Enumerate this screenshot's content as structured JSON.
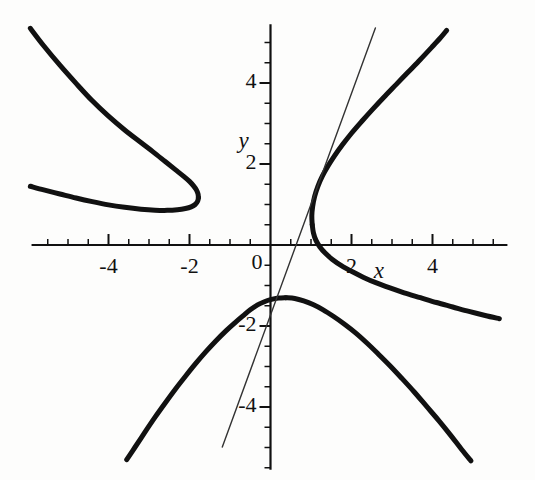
{
  "figure": {
    "width": 535,
    "height": 480,
    "background": "#fdfdfc",
    "ink_color": "#111111"
  },
  "axis_names": {
    "x": "x",
    "y": "y"
  },
  "chart_data": {
    "type": "line",
    "title": "",
    "subtitle": "",
    "xlabel": "x",
    "ylabel": "y",
    "grid": false,
    "legend": null,
    "legend_position": "none",
    "xlim": [
      -5.9,
      5.85
    ],
    "ylim": [
      -5.55,
      5.45
    ],
    "xticks_major": [
      -4,
      -2,
      0,
      2,
      4
    ],
    "yticks_major": [
      -4,
      -2,
      0,
      2,
      4
    ],
    "xtick_labels": [
      "-4",
      "-2",
      "0",
      "2",
      "4"
    ],
    "ytick_labels": [
      "-4",
      "-2",
      "0",
      "2",
      "4"
    ],
    "minor_tick_step": 0.5,
    "axes_style": "centered-cross",
    "curve_description": "elliptic curve with two real components: a closed oval on the left and an unbounded branch on the right, plus a straight secant line",
    "series": [
      {
        "name": "oval-component-upper",
        "style": "thick",
        "linewidth": 5,
        "color": "#111111",
        "points": [
          [
            -5.93,
            5.35
          ],
          [
            -5.6,
            4.92
          ],
          [
            -5.2,
            4.44
          ],
          [
            -4.8,
            3.99
          ],
          [
            -4.4,
            3.56
          ],
          [
            -4.0,
            3.18
          ],
          [
            -3.6,
            2.84
          ],
          [
            -3.2,
            2.53
          ],
          [
            -2.9,
            2.3
          ],
          [
            -2.6,
            2.06
          ],
          [
            -2.35,
            1.86
          ],
          [
            -2.15,
            1.7
          ],
          [
            -2.0,
            1.57
          ],
          [
            -1.9,
            1.46
          ],
          [
            -1.83,
            1.36
          ],
          [
            -1.79,
            1.26
          ],
          [
            -1.78,
            1.17
          ]
        ]
      },
      {
        "name": "oval-component-lower",
        "style": "thick",
        "linewidth": 5,
        "color": "#111111",
        "points": [
          [
            -1.78,
            1.17
          ],
          [
            -1.8,
            1.08
          ],
          [
            -1.86,
            1.0
          ],
          [
            -1.96,
            0.94
          ],
          [
            -2.1,
            0.9
          ],
          [
            -2.3,
            0.87
          ],
          [
            -2.55,
            0.855
          ],
          [
            -2.85,
            0.86
          ],
          [
            -3.2,
            0.885
          ],
          [
            -3.6,
            0.93
          ],
          [
            -4.0,
            0.99
          ],
          [
            -4.4,
            1.07
          ],
          [
            -4.8,
            1.16
          ],
          [
            -5.2,
            1.26
          ],
          [
            -5.6,
            1.36
          ],
          [
            -5.93,
            1.45
          ]
        ]
      },
      {
        "name": "right-branch-upper",
        "style": "thick",
        "linewidth": 5,
        "color": "#111111",
        "points": [
          [
            1.03,
            0.5
          ],
          [
            1.02,
            0.72
          ],
          [
            1.04,
            0.95
          ],
          [
            1.09,
            1.2
          ],
          [
            1.17,
            1.45
          ],
          [
            1.28,
            1.7
          ],
          [
            1.42,
            1.95
          ],
          [
            1.58,
            2.2
          ],
          [
            1.78,
            2.48
          ],
          [
            2.0,
            2.76
          ],
          [
            2.25,
            3.05
          ],
          [
            2.52,
            3.35
          ],
          [
            2.8,
            3.65
          ],
          [
            3.1,
            3.96
          ],
          [
            3.4,
            4.27
          ],
          [
            3.7,
            4.58
          ],
          [
            3.98,
            4.88
          ],
          [
            4.2,
            5.12
          ],
          [
            4.35,
            5.3
          ]
        ]
      },
      {
        "name": "right-branch-lower",
        "style": "thick",
        "linewidth": 5,
        "color": "#111111",
        "points": [
          [
            1.03,
            0.5
          ],
          [
            1.06,
            0.3
          ],
          [
            1.12,
            0.12
          ],
          [
            1.22,
            -0.05
          ],
          [
            1.35,
            -0.2
          ],
          [
            1.52,
            -0.35
          ],
          [
            1.75,
            -0.51
          ],
          [
            2.0,
            -0.65
          ],
          [
            2.3,
            -0.8
          ],
          [
            2.6,
            -0.93
          ],
          [
            2.95,
            -1.06
          ],
          [
            3.3,
            -1.18
          ],
          [
            3.7,
            -1.3
          ],
          [
            4.1,
            -1.42
          ],
          [
            4.5,
            -1.53
          ],
          [
            4.9,
            -1.64
          ],
          [
            5.3,
            -1.74
          ],
          [
            5.65,
            -1.82
          ]
        ]
      },
      {
        "name": "reflected-branch-left",
        "style": "thick",
        "linewidth": 5,
        "color": "#111111",
        "points": [
          [
            -3.55,
            -5.3
          ],
          [
            -3.35,
            -5.0
          ],
          [
            -3.1,
            -4.62
          ],
          [
            -2.85,
            -4.25
          ],
          [
            -2.6,
            -3.9
          ],
          [
            -2.35,
            -3.56
          ],
          [
            -2.1,
            -3.24
          ],
          [
            -1.85,
            -2.93
          ],
          [
            -1.6,
            -2.64
          ],
          [
            -1.35,
            -2.37
          ],
          [
            -1.1,
            -2.12
          ],
          [
            -0.88,
            -1.92
          ],
          [
            -0.68,
            -1.75
          ],
          [
            -0.5,
            -1.6
          ],
          [
            -0.32,
            -1.48
          ],
          [
            -0.15,
            -1.4
          ],
          [
            0.0,
            -1.35
          ],
          [
            0.2,
            -1.31
          ],
          [
            0.38,
            -1.3
          ]
        ]
      },
      {
        "name": "reflected-branch-right",
        "style": "thick",
        "linewidth": 5,
        "color": "#111111",
        "points": [
          [
            0.38,
            -1.3
          ],
          [
            0.6,
            -1.32
          ],
          [
            0.82,
            -1.38
          ],
          [
            1.05,
            -1.47
          ],
          [
            1.3,
            -1.6
          ],
          [
            1.55,
            -1.76
          ],
          [
            1.82,
            -1.95
          ],
          [
            2.1,
            -2.17
          ],
          [
            2.38,
            -2.42
          ],
          [
            2.65,
            -2.68
          ],
          [
            2.95,
            -2.98
          ],
          [
            3.25,
            -3.3
          ],
          [
            3.55,
            -3.63
          ],
          [
            3.85,
            -3.98
          ],
          [
            4.15,
            -4.33
          ],
          [
            4.45,
            -4.7
          ],
          [
            4.72,
            -5.05
          ],
          [
            4.95,
            -5.33
          ]
        ]
      },
      {
        "name": "secant-line",
        "style": "thin",
        "linewidth": 1.4,
        "color": "#333333",
        "points": [
          [
            -1.19,
            -4.99
          ],
          [
            2.59,
            5.36
          ]
        ],
        "slope": 2.74,
        "y_intercept": -1.73
      }
    ]
  }
}
